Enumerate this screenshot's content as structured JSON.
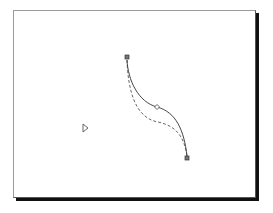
{
  "diagram": {
    "type": "bezier-curve-edit",
    "colors": {
      "background": "#ffffff",
      "frame_border": "#9a9a9a",
      "frame_shadow": "#111111",
      "curve": "#444444",
      "dashed_curve": "#666666",
      "node_fill": "#888888"
    },
    "nodes": [
      {
        "name": "start-node",
        "shape": "square",
        "x": 127,
        "y": 57
      },
      {
        "name": "mid-node",
        "shape": "diamond",
        "x": 157,
        "y": 107
      },
      {
        "name": "end-node",
        "shape": "square",
        "x": 187,
        "y": 158
      }
    ],
    "solid_curve": "M127,60 C128,80 138,102 157,107 C176,112 184,130 187,156",
    "dashed_curve": "M127,60 C128,90 135,118 158,122 C176,126 184,136 187,156",
    "cursor": {
      "icon": "triangle-cursor-icon",
      "x": 85,
      "y": 128
    }
  }
}
